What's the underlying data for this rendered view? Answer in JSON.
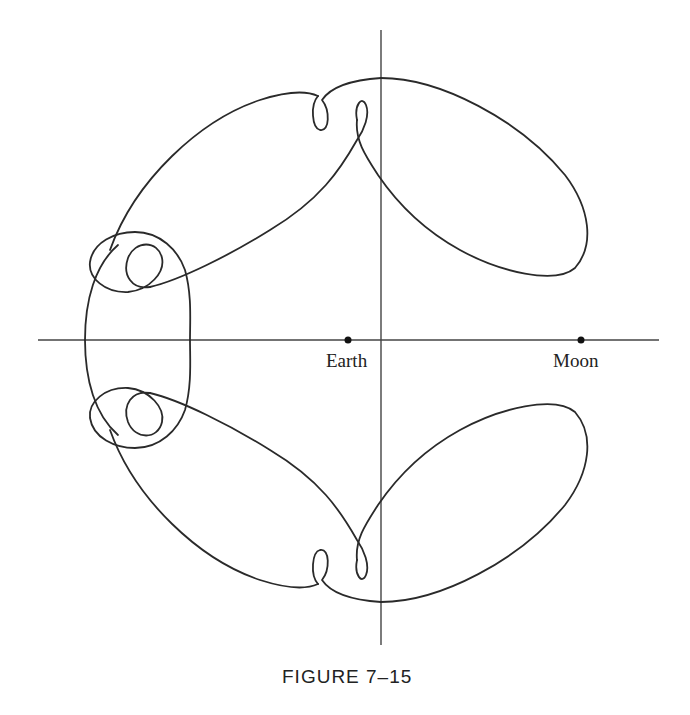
{
  "figure": {
    "caption": "FIGURE 7–15",
    "labels": {
      "earth": "Earth",
      "moon": "Moon"
    },
    "colors": {
      "line": "#2a2a2a",
      "axis": "#444444",
      "background": "#ffffff"
    }
  },
  "diagram": {
    "type": "trajectory-plot",
    "axes": {
      "horizontal": {
        "x1": 38,
        "x2": 659,
        "y": 340
      },
      "vertical": {
        "x": 381,
        "y1": 30,
        "y2": 645
      }
    },
    "points": [
      {
        "name": "Earth",
        "x": 348,
        "y": 340
      },
      {
        "name": "Moon",
        "x": 581,
        "y": 340
      }
    ],
    "curve": "Closed looping orbit symmetric about the Earth–Moon axis, with lobes toward the Moon and small retrograde loops"
  }
}
